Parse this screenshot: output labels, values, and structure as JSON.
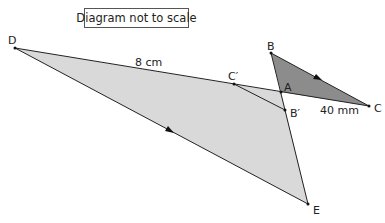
{
  "note": "Diagram not to scale",
  "colors": {
    "large_triangle_fill": "#d9d9d9",
    "small_triangle_fill": "#8c8c8c",
    "stroke": "#222222"
  },
  "points": {
    "D": {
      "label": "D",
      "x": 15,
      "y": 48
    },
    "B": {
      "label": "B",
      "x": 271,
      "y": 53
    },
    "A": {
      "label": "A",
      "x": 281,
      "y": 92
    },
    "C_prime": {
      "label": "C′",
      "x": 234,
      "y": 84
    },
    "B_prime": {
      "label": "B′",
      "x": 285,
      "y": 110
    },
    "C": {
      "label": "C",
      "x": 369,
      "y": 106
    },
    "E": {
      "label": "E",
      "x": 308,
      "y": 204
    }
  },
  "measurements": {
    "DA": "8 cm",
    "AC": "40 mm"
  },
  "parallel_marks": [
    "BC",
    "DE"
  ]
}
